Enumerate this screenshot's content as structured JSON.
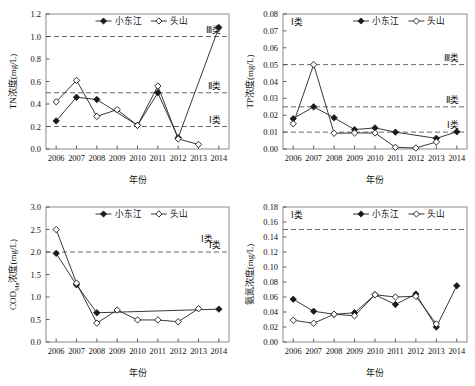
{
  "figure": {
    "x_categories": [
      "2006",
      "2007",
      "2008",
      "2009",
      "2010",
      "2011",
      "2012",
      "2013",
      "2014"
    ],
    "xlabel": "年份",
    "series_names": {
      "a": "小东江",
      "b": "头山"
    }
  },
  "chart_data": [
    {
      "id": "tn",
      "type": "line",
      "title": "",
      "xlabel": "年份",
      "ylabel": "TN浓度(mg/L)",
      "x": [
        "2006",
        "2007",
        "2008",
        "2009",
        "2010",
        "2011",
        "2012",
        "2013",
        "2014"
      ],
      "ylim": [
        0,
        1.2
      ],
      "yticks": [
        0.0,
        0.2,
        0.4,
        0.6,
        0.8,
        1.0,
        1.2
      ],
      "ytick_labels": [
        "0.0",
        "0.2",
        "0.4",
        "0.6",
        "0.8",
        "1.0",
        "1.2"
      ],
      "grid": false,
      "legend_position": "top-center",
      "series": [
        {
          "name": "小东江",
          "marker": "filled-diamond",
          "values": [
            0.25,
            0.46,
            0.44,
            null,
            0.21,
            0.5,
            0.1,
            null,
            1.08
          ]
        },
        {
          "name": "头山",
          "marker": "open-diamond",
          "values": [
            0.42,
            0.61,
            0.29,
            0.35,
            0.21,
            0.56,
            0.09,
            0.04,
            null
          ]
        }
      ],
      "thresholds": [
        {
          "value": 1.0,
          "label": "Ⅲ类"
        },
        {
          "value": 0.5,
          "label": "Ⅱ类"
        },
        {
          "value": 0.2,
          "label": "Ⅰ类"
        }
      ]
    },
    {
      "id": "tp",
      "type": "line",
      "title": "",
      "xlabel": "年份",
      "ylabel": "TP浓度(mg/L)",
      "x": [
        "2006",
        "2007",
        "2008",
        "2009",
        "2010",
        "2011",
        "2012",
        "2013",
        "2014"
      ],
      "ylim": [
        0,
        0.08
      ],
      "yticks": [
        0.0,
        0.01,
        0.02,
        0.03,
        0.04,
        0.05,
        0.06,
        0.07,
        0.08
      ],
      "ytick_labels": [
        "0.00",
        "0.01",
        "0.02",
        "0.03",
        "0.04",
        "0.05",
        "0.06",
        "0.07",
        "0.08"
      ],
      "grid": false,
      "legend_position": "top-center",
      "corner_label": "Ⅰ类",
      "series": [
        {
          "name": "小东江",
          "marker": "filled-diamond",
          "values": [
            0.018,
            0.025,
            0.0185,
            0.0115,
            0.0125,
            0.01,
            null,
            0.0063,
            0.0102
          ]
        },
        {
          "name": "头山",
          "marker": "open-diamond",
          "values": [
            0.015,
            0.05,
            0.0093,
            0.0095,
            0.0095,
            0.001,
            0.0006,
            0.0042,
            null
          ]
        }
      ],
      "thresholds": [
        {
          "value": 0.05,
          "label": "Ⅲ类"
        },
        {
          "value": 0.025,
          "label": "Ⅱ类"
        },
        {
          "value": 0.01,
          "label": "Ⅰ类"
        }
      ]
    },
    {
      "id": "cod",
      "type": "line",
      "title": "",
      "xlabel": "年份",
      "ylabel": "COD_Mn浓度(mg/L)",
      "ylabel_parts": {
        "main": "COD",
        "sub": "Mn",
        "tail": "浓度(mg/L)"
      },
      "x": [
        "2006",
        "2007",
        "2008",
        "2009",
        "2010",
        "2011",
        "2012",
        "2013",
        "2014"
      ],
      "ylim": [
        0,
        3.0
      ],
      "yticks": [
        0.0,
        0.5,
        1.0,
        1.5,
        2.0,
        2.5,
        3.0
      ],
      "ytick_labels": [
        "0.0",
        "0.5",
        "1.0",
        "1.5",
        "2.0",
        "2.5",
        "3.0"
      ],
      "grid": false,
      "legend_position": "top-center",
      "corner_label": "Ⅰ类",
      "series": [
        {
          "name": "小东江",
          "marker": "filled-diamond",
          "values": [
            1.97,
            1.27,
            0.65,
            null,
            null,
            null,
            null,
            null,
            0.73
          ]
        },
        {
          "name": "头山",
          "marker": "open-diamond",
          "values": [
            2.5,
            1.31,
            0.42,
            0.71,
            0.49,
            0.49,
            0.45,
            0.74,
            null
          ]
        }
      ],
      "thresholds": [
        {
          "value": 2.0,
          "label": "Ⅰ类"
        }
      ]
    },
    {
      "id": "nh3n",
      "type": "line",
      "title": "",
      "xlabel": "年份",
      "ylabel": "氨氮浓度(mg/L)",
      "x": [
        "2006",
        "2007",
        "2008",
        "2009",
        "2010",
        "2011",
        "2012",
        "2013",
        "2014"
      ],
      "ylim": [
        0,
        0.18
      ],
      "yticks": [
        0.0,
        0.02,
        0.04,
        0.06,
        0.08,
        0.1,
        0.12,
        0.14,
        0.16,
        0.18
      ],
      "ytick_labels": [
        "0.00",
        "0.02",
        "0.04",
        "0.06",
        "0.08",
        "0.10",
        "0.12",
        "0.14",
        "0.16",
        "0.18"
      ],
      "grid": false,
      "legend_position": "top-center",
      "corner_label": "Ⅰ类",
      "series": [
        {
          "name": "小东江",
          "marker": "filled-diamond",
          "values": [
            0.057,
            0.041,
            0.037,
            0.039,
            0.063,
            0.05,
            0.064,
            0.02,
            0.075
          ]
        },
        {
          "name": "头山",
          "marker": "open-diamond",
          "values": [
            0.029,
            0.025,
            0.037,
            0.035,
            0.063,
            0.06,
            0.061,
            0.024,
            null
          ]
        }
      ],
      "thresholds": [
        {
          "value": 0.15,
          "label": ""
        }
      ]
    }
  ]
}
